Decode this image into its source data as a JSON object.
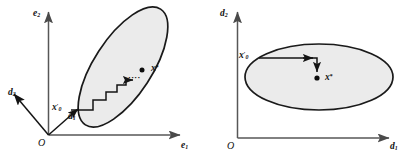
{
  "figure": {
    "type": "diagram",
    "background_color": "#ffffff",
    "ellipse_fill": "#ebebeb",
    "ellipse_stroke": "#1a1a1a",
    "axis_color": "#555555",
    "path_color": "#111111"
  },
  "left_panel": {
    "name": "original-coordinates-panel",
    "axes": {
      "vertical_label": "e",
      "vertical_sub": "2",
      "horizontal_label": "e",
      "horizontal_sub": "1",
      "origin_label": "O"
    },
    "directions": [
      {
        "label": "d",
        "sub": "2",
        "description": "skew direction vector pointing down-left from origin"
      },
      {
        "label": "d",
        "sub": "1",
        "description": "skew direction vector pointing up-right along ellipse major axis"
      }
    ],
    "points": [
      {
        "name": "start-point",
        "label": "x",
        "sub": "0",
        "prime": "′",
        "description": "starting iterate on the left edge of the tilted ellipse"
      },
      {
        "name": "optimum-point",
        "label": "x",
        "star": "*",
        "description": "optimal solution marked with filled dot inside the ellipse"
      }
    ],
    "path": {
      "name": "staircase-path",
      "style": "staircase",
      "annotation": "····",
      "steps": 5,
      "description": "alternating horizontal/vertical coordinate descent steps from x0' toward x*"
    },
    "region": {
      "shape": "ellipse",
      "tilt_degrees": 58,
      "description": "tilted shaded feasible ellipse"
    }
  },
  "right_panel": {
    "name": "transformed-coordinates-panel",
    "axes": {
      "vertical_label": "d",
      "vertical_sub": "2",
      "horizontal_label": "d",
      "horizontal_sub": "1",
      "origin_label": "O"
    },
    "points": [
      {
        "name": "start-point",
        "label": "x",
        "sub": "0",
        "prime": "′",
        "description": "starting iterate on the left of the axis-aligned ellipse"
      },
      {
        "name": "optimum-point",
        "label": "x",
        "star": "*",
        "description": "optimal solution marked with filled dot at ellipse centre"
      }
    ],
    "path": {
      "name": "two-step-path",
      "style": "right-angle",
      "steps": 2,
      "description": "one horizontal step then one vertical step from x0' to x*"
    },
    "region": {
      "shape": "ellipse",
      "tilt_degrees": 0,
      "description": "axis-aligned shaded feasible ellipse"
    }
  }
}
